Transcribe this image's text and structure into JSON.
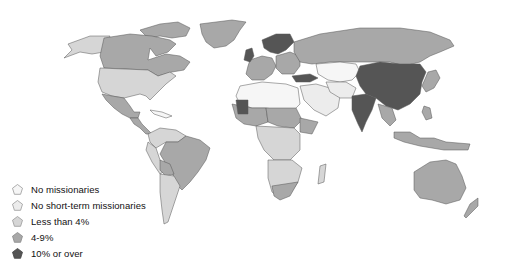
{
  "map": {
    "type": "choropleth",
    "region": "World",
    "colors": {
      "none": "#f6f6f6",
      "no_short_term": "#ececec",
      "lt4": "#d6d6d6",
      "4to9": "#a8a8a8",
      "ge10": "#555555",
      "ocean": "#ffffff",
      "border": "#555555"
    }
  },
  "legend": {
    "items": [
      {
        "label": "No missionaries",
        "color": "#f6f6f6"
      },
      {
        "label": "No short-term missionaries",
        "color": "#ececec"
      },
      {
        "label": "Less than 4%",
        "color": "#d6d6d6"
      },
      {
        "label": "4-9%",
        "color": "#a8a8a8"
      },
      {
        "label": "10% or over",
        "color": "#555555"
      }
    ]
  }
}
